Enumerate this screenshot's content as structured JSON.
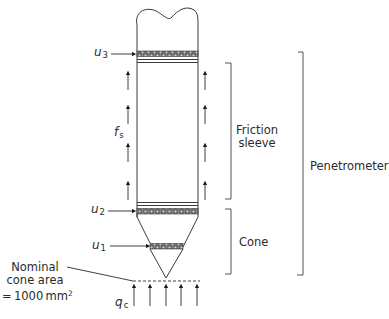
{
  "figure": {
    "type": "schematic",
    "colors": {
      "line": "#3a3a3a",
      "filter": "#555555",
      "background": "#ffffff"
    }
  },
  "labels": {
    "u3": {
      "symbol": "u",
      "sub": "3"
    },
    "u2": {
      "symbol": "u",
      "sub": "2"
    },
    "u1": {
      "symbol": "u",
      "sub": "1"
    },
    "fs": {
      "symbol": "f",
      "sub": "s"
    },
    "qc": {
      "symbol": "q",
      "sub": "c"
    },
    "friction_sleeve_line1": "Friction",
    "friction_sleeve_line2": "sleeve",
    "cone": "Cone",
    "penetrometer": "Penetrometer",
    "nominal_line1": "Nominal",
    "nominal_line2": "cone area",
    "nominal_line3_prefix": "= 1000 mm",
    "nominal_line3_sup": "2"
  },
  "brackets": [
    {
      "name": "friction-sleeve",
      "top": 63,
      "bottom": 199
    },
    {
      "name": "cone",
      "top": 209,
      "bottom": 274
    },
    {
      "name": "penetrometer",
      "top": 52,
      "bottom": 275
    }
  ],
  "shaft_arrows_count_per_side": 4,
  "base_arrows_count": 5
}
